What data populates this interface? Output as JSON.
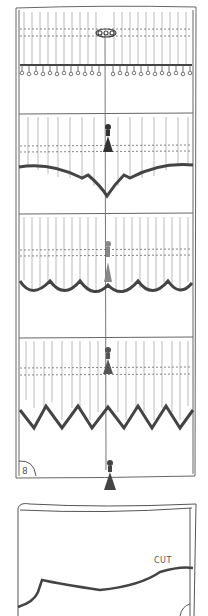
{
  "figure": {
    "page_number": "8",
    "cut_label": "CUT",
    "panels": [
      {
        "name": "shade-with-bead-fringe",
        "hem_style": "bead-fringe",
        "ornament": "scroll-knob"
      },
      {
        "name": "shade-with-arched-point-hem",
        "hem_style": "arched-center-point",
        "ornament": "tassel"
      },
      {
        "name": "shade-with-scalloped-hem",
        "hem_style": "scallop",
        "ornament": "tassel"
      },
      {
        "name": "shade-with-zigzag-hem",
        "hem_style": "zigzag",
        "ornament": "tassel"
      }
    ],
    "detail": {
      "name": "cut-pattern-detail",
      "description": "fabric panel with cut line"
    },
    "colors": {
      "line": "#555555",
      "hem": "#444444",
      "stripe": "#bbbbbb",
      "paper": "#ffffff"
    }
  }
}
